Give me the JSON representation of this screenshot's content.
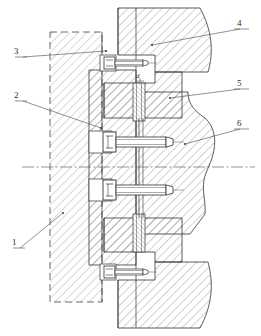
{
  "drawing": {
    "title": "Mechanical assembly cross-section",
    "view_type": "sectional-view",
    "line_color": "#333333",
    "hatch_color": "#555555",
    "center_line_color": "#666666",
    "background": "#ffffff"
  },
  "callouts": [
    {
      "id": "1",
      "label": "1",
      "x": 14,
      "y": 243,
      "target_x": 63,
      "target_y": 213,
      "underline": true,
      "desc": "base-plate-dashed-block"
    },
    {
      "id": "2",
      "label": "2",
      "x": 16,
      "y": 96,
      "target_x": 101,
      "target_y": 128,
      "underline": true,
      "desc": "hatched-body-block"
    },
    {
      "id": "3",
      "label": "3",
      "x": 16,
      "y": 48,
      "target_x": 106,
      "target_y": 51,
      "underline": true,
      "desc": "upper-bolt-head"
    },
    {
      "id": "4",
      "label": "4",
      "x": 238,
      "y": 20,
      "target_x": 152,
      "target_y": 45,
      "underline": true,
      "desc": "upper-curved-part"
    },
    {
      "id": "5",
      "label": "5",
      "x": 238,
      "y": 80,
      "target_x": 170,
      "target_y": 98,
      "underline": true,
      "desc": "middle-step-part"
    },
    {
      "id": "6",
      "label": "6",
      "x": 238,
      "y": 120,
      "target_x": 185,
      "target_y": 144,
      "underline": true,
      "desc": "right-curved-body"
    }
  ],
  "dimensions": [
    {
      "id": "d",
      "label": "d",
      "x": 138,
      "y": 79,
      "desc": "pin-diameter-symbol"
    }
  ],
  "fasteners": [
    {
      "name": "socket-head-screw-top",
      "cx": 128,
      "cy": 63,
      "length": 36,
      "size": "small"
    },
    {
      "name": "socket-head-screw-mid-1",
      "cx": 132,
      "cy": 143,
      "length": 60,
      "size": "large"
    },
    {
      "name": "socket-head-screw-mid-2",
      "cx": 132,
      "cy": 191,
      "length": 60,
      "size": "large"
    },
    {
      "name": "socket-head-screw-bottom",
      "cx": 128,
      "cy": 272,
      "length": 36,
      "size": "small"
    }
  ],
  "center_line": {
    "y": 167,
    "x1": 22,
    "x2": 255
  }
}
